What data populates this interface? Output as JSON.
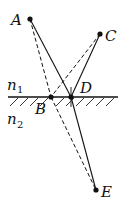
{
  "diagram": {
    "media": {
      "upper": {
        "label": "n",
        "subscript": "1"
      },
      "lower": {
        "label": "n",
        "subscript": "2"
      }
    },
    "points": {
      "A": {
        "label": "A",
        "x": 30,
        "y": 19
      },
      "C": {
        "label": "C",
        "x": 100,
        "y": 34
      },
      "B": {
        "label": "B",
        "x": 51,
        "y": 97
      },
      "D": {
        "label": "D",
        "x": 71,
        "y": 97
      },
      "E": {
        "label": "E",
        "x": 96,
        "y": 190
      }
    },
    "segments": {
      "solid": [
        [
          "A",
          "D"
        ],
        [
          "C",
          "D"
        ],
        [
          "D",
          "E"
        ]
      ],
      "dashed": [
        [
          "A",
          "B"
        ],
        [
          "C",
          "B"
        ],
        [
          "B",
          "E"
        ]
      ]
    },
    "interface": {
      "x1": 8,
      "x2": 118,
      "y": 97
    },
    "normal_at_D": {
      "x": 71,
      "y1": 87,
      "y2": 107
    },
    "colors": {
      "ink": "#111111",
      "background": "#ffffff"
    }
  }
}
